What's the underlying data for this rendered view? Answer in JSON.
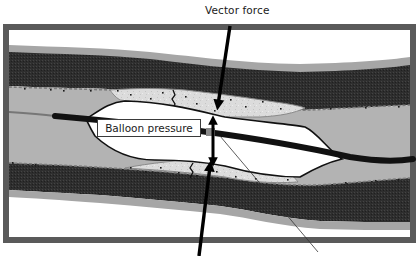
{
  "figure": {
    "labels": {
      "vector_force": "Vector force",
      "balloon_pressure": "Balloon pressure"
    },
    "components": [
      "vessel-wall-adventitia",
      "vessel-wall-media",
      "intima",
      "plaque-top",
      "plaque-bottom",
      "plaque-fissure",
      "lumen",
      "balloon",
      "catheter-shaft",
      "guidewire",
      "radiopaque-marker",
      "vector-force-arrow-top",
      "vector-force-arrow-bottom",
      "balloon-pressure-double-arrow",
      "pointer-line"
    ],
    "colors": {
      "frame": "#5a5a5a",
      "background": "#ffffff",
      "adventitia": "#a6a6a6",
      "media": "#2b2b2b",
      "lumen": "#b3b3b3",
      "plaque": "#d9d9d9",
      "balloon": "#ffffff",
      "catheter": "#111111",
      "arrow": "#000000"
    }
  }
}
